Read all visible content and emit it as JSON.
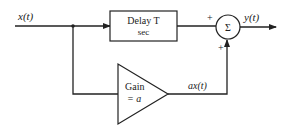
{
  "diagram": {
    "input_label": "x(t)",
    "delay_block": {
      "line1": "Delay T",
      "line2": "sec"
    },
    "summer": {
      "symbol": "Σ",
      "sign_top": "+",
      "sign_bottom": "+"
    },
    "output_label": "y(t)",
    "gain_block": {
      "line1": "Gain",
      "line2": "= a"
    },
    "gain_output_label": "ax(t)",
    "colors": {
      "stroke": "#222222",
      "background": "#ffffff"
    }
  }
}
